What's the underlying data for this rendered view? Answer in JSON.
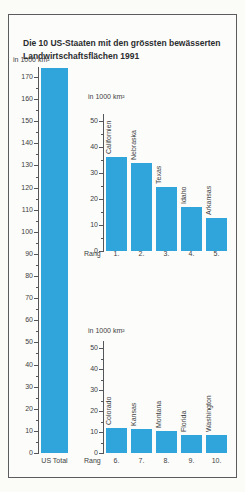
{
  "title": {
    "line1": "Die 10 US-Staaten mit den grössten bewässerten",
    "line2": "Landwirtschaftsflächen 1991"
  },
  "accent_color": "#2fa5dc",
  "chart_data": [
    {
      "id": "us-total",
      "type": "bar",
      "title": "US Total bewässerte Landwirtschaftsfläche",
      "unit_label": "in 1000 km²",
      "categories": [
        "US Total"
      ],
      "values": [
        174
      ],
      "ylim": [
        0,
        175
      ],
      "yticks": [
        0,
        10,
        20,
        30,
        40,
        50,
        60,
        70,
        80,
        90,
        100,
        110,
        120,
        130,
        140,
        150,
        160,
        170
      ],
      "legend": "none",
      "grid": "off"
    },
    {
      "id": "rang-1-5",
      "type": "bar",
      "title": "Rang 1 bis 5",
      "unit_label": "in 1000 km²",
      "xlabel": "Rang",
      "categories": [
        "Californien",
        "Nebraska",
        "Texas",
        "Idaho",
        "Arkansas"
      ],
      "rank_labels": [
        "1.",
        "2.",
        "3.",
        "4.",
        "5."
      ],
      "values": [
        36,
        34,
        24.5,
        17,
        12.5
      ],
      "ylim": [
        0,
        55
      ],
      "yticks": [
        0,
        10,
        20,
        30,
        40,
        50
      ],
      "legend": "none",
      "grid": "off"
    },
    {
      "id": "rang-6-10",
      "type": "bar",
      "title": "Rang 6 bis 10",
      "unit_label": "in 1000 km²",
      "xlabel": "Rang",
      "categories": [
        "Colorado",
        "Kansas",
        "Montana",
        "Florida",
        "Washington"
      ],
      "rank_labels": [
        "6.",
        "7.",
        "8.",
        "9.",
        "10."
      ],
      "values": [
        12,
        11.5,
        10.5,
        8.5,
        8.5
      ],
      "ylim": [
        0,
        55
      ],
      "yticks": [
        0,
        10,
        20,
        30,
        40,
        50
      ],
      "legend": "none",
      "grid": "off"
    }
  ]
}
